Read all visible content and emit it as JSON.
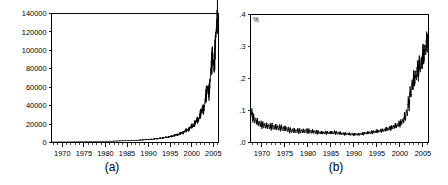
{
  "figure": {
    "panels": [
      {
        "id": "a",
        "caption": "(a)",
        "unit_annotation": ""
      },
      {
        "id": "b",
        "caption": "(b)",
        "unit_annotation": "%"
      }
    ]
  },
  "chart_data": [
    {
      "type": "line",
      "panel": "(a)",
      "title": "",
      "xlabel": "",
      "ylabel": "",
      "xlim": [
        1967.5,
        2006.2
      ],
      "ylim": [
        0,
        140000
      ],
      "grid": false,
      "legend": "none",
      "xticks": [
        1970,
        1975,
        1980,
        1985,
        1990,
        1995,
        2000,
        2005
      ],
      "xticklabels": [
        "1970",
        "1975",
        "1980",
        "1985",
        "1990",
        "1995",
        "2000",
        "2005"
      ],
      "yticks": [
        0,
        20000,
        40000,
        60000,
        80000,
        100000,
        120000,
        140000
      ],
      "yticklabels": [
        "0",
        "20000",
        "40000",
        "60000",
        "80000",
        "100000",
        "120000",
        "140000"
      ],
      "series": [
        {
          "name": "level",
          "x": [
            1967.6,
            1968.0,
            1968.4,
            1968.8,
            1969.2,
            1969.6,
            1970.0,
            1970.4,
            1970.8,
            1971.2,
            1971.6,
            1972.0,
            1972.4,
            1972.8,
            1973.2,
            1973.6,
            1974.0,
            1974.4,
            1974.8,
            1975.2,
            1975.6,
            1976.0,
            1976.4,
            1976.8,
            1977.2,
            1977.6,
            1978.0,
            1978.4,
            1978.8,
            1979.2,
            1979.6,
            1980.0,
            1980.4,
            1980.8,
            1981.2,
            1981.6,
            1982.0,
            1982.4,
            1982.8,
            1983.2,
            1983.6,
            1984.0,
            1984.4,
            1984.8,
            1985.2,
            1985.6,
            1986.0,
            1986.4,
            1986.8,
            1987.2,
            1987.6,
            1988.0,
            1988.4,
            1988.8,
            1989.2,
            1989.6,
            1990.0,
            1990.4,
            1990.8,
            1991.2,
            1991.6,
            1992.0,
            1992.4,
            1992.8,
            1993.2,
            1993.6,
            1994.0,
            1994.4,
            1994.8,
            1995.2,
            1995.6,
            1996.0,
            1996.4,
            1996.8,
            1997.2,
            1997.6,
            1998.0,
            1998.4,
            1998.8,
            1999.2,
            1999.6,
            2000.0,
            2000.4,
            2000.8,
            2001.2,
            2001.6,
            2002.0,
            2002.4,
            2002.8,
            2003.2,
            2003.6,
            2004.0,
            2004.4,
            2004.8,
            2005.2,
            2005.6,
            2006.0
          ],
          "y": [
            520,
            500,
            530,
            560,
            540,
            575,
            600,
            590,
            630,
            650,
            640,
            690,
            710,
            700,
            760,
            790,
            780,
            840,
            870,
            860,
            910,
            950,
            940,
            1000,
            1040,
            1030,
            1100,
            1150,
            1140,
            1220,
            1270,
            1260,
            1340,
            1400,
            1390,
            1480,
            1550,
            1540,
            1640,
            1710,
            1700,
            1820,
            1900,
            1890,
            2020,
            2120,
            2110,
            2260,
            2370,
            2360,
            2540,
            2670,
            2660,
            2880,
            3040,
            3030,
            3300,
            3500,
            3490,
            3820,
            4060,
            4050,
            4460,
            4760,
            4750,
            5280,
            5660,
            5650,
            6350,
            6840,
            6830,
            7750,
            8400,
            8390,
            9650,
            10550,
            10500,
            12300,
            13600,
            13500,
            16100,
            18000,
            17800,
            21800,
            24500,
            24100,
            31000,
            37000,
            35500,
            48000,
            60000,
            54000,
            75000,
            95000,
            82000,
            118000,
            138000
          ]
        }
      ]
    },
    {
      "type": "line",
      "panel": "(b)",
      "title": "",
      "xlabel": "",
      "ylabel": "",
      "unit": "%",
      "xlim": [
        1967.5,
        2006.2
      ],
      "ylim": [
        0.0,
        0.4
      ],
      "grid": false,
      "legend": "none",
      "xticks": [
        1970,
        1975,
        1980,
        1985,
        1990,
        1995,
        2000,
        2005
      ],
      "xticklabels": [
        "1970",
        "1975",
        "1980",
        "1985",
        "1990",
        "1995",
        "2000",
        "2005"
      ],
      "yticks": [
        0.0,
        0.1,
        0.2,
        0.3,
        0.4
      ],
      "yticklabels": [
        ".0",
        ".1",
        ".2",
        ".3",
        ".4"
      ],
      "series": [
        {
          "name": "share",
          "x": [
            1967.6,
            1967.8,
            1968.0,
            1968.2,
            1968.4,
            1968.6,
            1968.8,
            1969.0,
            1969.2,
            1969.4,
            1969.6,
            1969.8,
            1970.0,
            1970.2,
            1970.4,
            1970.6,
            1970.8,
            1971.0,
            1971.2,
            1971.4,
            1971.6,
            1971.8,
            1972.0,
            1972.2,
            1972.4,
            1972.6,
            1972.8,
            1973.0,
            1973.2,
            1973.4,
            1973.6,
            1973.8,
            1974.0,
            1974.2,
            1974.4,
            1974.6,
            1974.8,
            1975.0,
            1975.2,
            1975.4,
            1975.6,
            1975.8,
            1976.0,
            1976.2,
            1976.4,
            1976.6,
            1976.8,
            1977.0,
            1977.2,
            1977.4,
            1977.6,
            1977.8,
            1978.0,
            1978.2,
            1978.4,
            1978.6,
            1978.8,
            1979.0,
            1979.2,
            1979.4,
            1979.6,
            1979.8,
            1980.0,
            1980.2,
            1980.4,
            1980.6,
            1980.8,
            1981.0,
            1981.2,
            1981.4,
            1981.6,
            1981.8,
            1982.0,
            1982.2,
            1982.4,
            1982.6,
            1982.8,
            1983.0,
            1983.2,
            1983.4,
            1983.6,
            1983.8,
            1984.0,
            1984.2,
            1984.4,
            1984.6,
            1984.8,
            1985.0,
            1985.2,
            1985.4,
            1985.6,
            1985.8,
            1986.0,
            1986.2,
            1986.4,
            1986.6,
            1986.8,
            1987.0,
            1987.2,
            1987.4,
            1987.6,
            1987.8,
            1988.0,
            1988.2,
            1988.4,
            1988.6,
            1988.8,
            1989.0,
            1989.2,
            1989.4,
            1989.6,
            1989.8,
            1990.0,
            1990.2,
            1990.4,
            1990.6,
            1990.8,
            1991.0,
            1991.2,
            1991.4,
            1991.6,
            1991.8,
            1992.0,
            1992.2,
            1992.4,
            1992.6,
            1992.8,
            1993.0,
            1993.2,
            1993.4,
            1993.6,
            1993.8,
            1994.0,
            1994.2,
            1994.4,
            1994.6,
            1994.8,
            1995.0,
            1995.2,
            1995.4,
            1995.6,
            1995.8,
            1996.0,
            1996.2,
            1996.4,
            1996.6,
            1996.8,
            1997.0,
            1997.2,
            1997.4,
            1997.6,
            1997.8,
            1998.0,
            1998.2,
            1998.4,
            1998.6,
            1998.8,
            1999.0,
            1999.2,
            1999.4,
            1999.6,
            1999.8,
            2000.0,
            2000.2,
            2000.4,
            2000.6,
            2000.8,
            2001.0,
            2001.2,
            2001.4,
            2001.6,
            2001.8,
            2002.0,
            2002.2,
            2002.4,
            2002.6,
            2002.8,
            2003.0,
            2003.2,
            2003.4,
            2003.6,
            2003.8,
            2004.0,
            2004.2,
            2004.4,
            2004.6,
            2004.8,
            2005.0,
            2005.2,
            2005.4,
            2005.6,
            2005.8,
            2006.0
          ],
          "y": [
            0.082,
            0.1,
            0.07,
            0.085,
            0.062,
            0.078,
            0.058,
            0.072,
            0.053,
            0.068,
            0.05,
            0.064,
            0.048,
            0.062,
            0.046,
            0.062,
            0.045,
            0.059,
            0.044,
            0.058,
            0.043,
            0.057,
            0.042,
            0.058,
            0.042,
            0.056,
            0.041,
            0.055,
            0.04,
            0.054,
            0.039,
            0.053,
            0.039,
            0.053,
            0.038,
            0.051,
            0.037,
            0.05,
            0.036,
            0.049,
            0.034,
            0.046,
            0.032,
            0.044,
            0.031,
            0.044,
            0.031,
            0.043,
            0.031,
            0.042,
            0.031,
            0.042,
            0.03,
            0.042,
            0.03,
            0.042,
            0.03,
            0.041,
            0.03,
            0.042,
            0.03,
            0.042,
            0.03,
            0.041,
            0.029,
            0.04,
            0.029,
            0.039,
            0.029,
            0.038,
            0.028,
            0.037,
            0.028,
            0.036,
            0.027,
            0.035,
            0.027,
            0.034,
            0.027,
            0.034,
            0.027,
            0.034,
            0.027,
            0.034,
            0.027,
            0.034,
            0.027,
            0.034,
            0.027,
            0.035,
            0.027,
            0.035,
            0.027,
            0.034,
            0.026,
            0.033,
            0.026,
            0.032,
            0.025,
            0.031,
            0.025,
            0.03,
            0.024,
            0.03,
            0.024,
            0.029,
            0.024,
            0.029,
            0.023,
            0.029,
            0.023,
            0.028,
            0.023,
            0.028,
            0.023,
            0.028,
            0.023,
            0.028,
            0.023,
            0.029,
            0.024,
            0.03,
            0.025,
            0.031,
            0.026,
            0.032,
            0.027,
            0.033,
            0.028,
            0.034,
            0.028,
            0.035,
            0.029,
            0.036,
            0.03,
            0.037,
            0.031,
            0.038,
            0.032,
            0.039,
            0.033,
            0.04,
            0.034,
            0.041,
            0.035,
            0.043,
            0.036,
            0.045,
            0.038,
            0.047,
            0.039,
            0.049,
            0.041,
            0.051,
            0.043,
            0.054,
            0.045,
            0.057,
            0.047,
            0.06,
            0.05,
            0.064,
            0.053,
            0.068,
            0.057,
            0.075,
            0.062,
            0.09,
            0.07,
            0.105,
            0.085,
            0.135,
            0.11,
            0.165,
            0.145,
            0.195,
            0.17,
            0.21,
            0.185,
            0.225,
            0.2,
            0.24,
            0.215,
            0.255,
            0.225,
            0.265,
            0.24,
            0.285,
            0.26,
            0.305,
            0.28,
            0.325,
            0.3,
            0.345,
            0.315,
            0.37,
            0.33
          ]
        }
      ]
    }
  ]
}
